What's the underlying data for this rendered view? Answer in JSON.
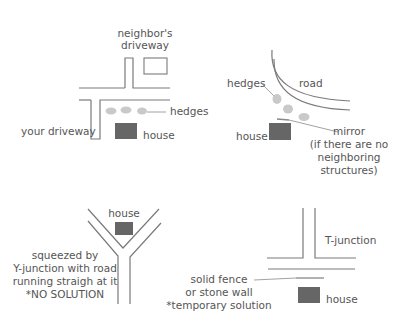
{
  "colors": {
    "road_line": "#7a7a7a",
    "house_fill": "#666666",
    "hedge_fill": "#c9c9c9",
    "text": "#555555"
  },
  "panels": {
    "driveway": {
      "neighbor_driveway_line1": "neighbor's",
      "neighbor_driveway_line2": "driveway",
      "hedges": "hedges",
      "your_driveway": "your driveway",
      "house": "house"
    },
    "curve": {
      "hedges": "hedges",
      "road": "road",
      "house": "house",
      "mirror_line1": "mirror",
      "mirror_line2": "(if there are no",
      "mirror_line3": "neighboring",
      "mirror_line4": "structures)"
    },
    "y_junction": {
      "house": "house",
      "desc_line1": "squeezed by",
      "desc_line2": "Y-junction with road",
      "desc_line3": "running straigh at it",
      "desc_line4": "*NO SOLUTION"
    },
    "t_junction": {
      "title": "T-junction",
      "fence_line1": "solid fence",
      "fence_line2": "or stone wall",
      "fence_line3": "*temporary solution",
      "house": "house"
    }
  }
}
